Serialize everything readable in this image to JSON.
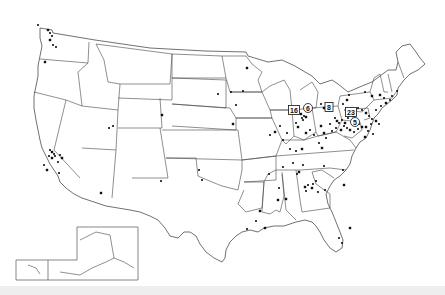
{
  "map": {
    "title": "United States site locations map",
    "colors": {
      "background": "#ffffff",
      "outline": "#444444",
      "marker": "#111111"
    },
    "cluster_labels": [
      {
        "text": "16",
        "shape": "box",
        "x": 294,
        "y": 110
      },
      {
        "text": "6",
        "shape": "circle",
        "x": 308,
        "y": 108
      },
      {
        "text": "8",
        "shape": "box",
        "x": 329,
        "y": 107
      },
      {
        "text": "23",
        "shape": "box",
        "x": 351,
        "y": 112
      },
      {
        "text": "5",
        "shape": "circle",
        "x": 355,
        "y": 122
      }
    ],
    "markers": [
      [
        48,
        30
      ],
      [
        50,
        33
      ],
      [
        52,
        36
      ],
      [
        50,
        40
      ],
      [
        53,
        45
      ],
      [
        56,
        47
      ],
      [
        45,
        62
      ],
      [
        38,
        25
      ],
      [
        50,
        150
      ],
      [
        52,
        152
      ],
      [
        54,
        154
      ],
      [
        49,
        156
      ],
      [
        52,
        158
      ],
      [
        55,
        156
      ],
      [
        60,
        155
      ],
      [
        62,
        158
      ],
      [
        58,
        162
      ],
      [
        44,
        165
      ],
      [
        47,
        170
      ],
      [
        59,
        173
      ],
      [
        109,
        128
      ],
      [
        101,
        193
      ],
      [
        161,
        181
      ],
      [
        113,
        126
      ],
      [
        162,
        115
      ],
      [
        202,
        180
      ],
      [
        199,
        170
      ],
      [
        233,
        124
      ],
      [
        236,
        105
      ],
      [
        231,
        92
      ],
      [
        247,
        68
      ],
      [
        243,
        91
      ],
      [
        218,
        94
      ],
      [
        301,
        114
      ],
      [
        304,
        116
      ],
      [
        302,
        118
      ],
      [
        306,
        117
      ],
      [
        303,
        120
      ],
      [
        296,
        123
      ],
      [
        298,
        127
      ],
      [
        280,
        126
      ],
      [
        270,
        135
      ],
      [
        275,
        132
      ],
      [
        283,
        140
      ],
      [
        287,
        133
      ],
      [
        306,
        133
      ],
      [
        310,
        130
      ],
      [
        314,
        135
      ],
      [
        321,
        126
      ],
      [
        330,
        124
      ],
      [
        335,
        118
      ],
      [
        337,
        121
      ],
      [
        339,
        123
      ],
      [
        342,
        120
      ],
      [
        345,
        123
      ],
      [
        344,
        126
      ],
      [
        347,
        128
      ],
      [
        350,
        130
      ],
      [
        352,
        124
      ],
      [
        348,
        118
      ],
      [
        353,
        116
      ],
      [
        356,
        119
      ],
      [
        359,
        124
      ],
      [
        362,
        127
      ],
      [
        358,
        129
      ],
      [
        354,
        132
      ],
      [
        341,
        130
      ],
      [
        336,
        128
      ],
      [
        332,
        131
      ],
      [
        324,
        133
      ],
      [
        326,
        138
      ],
      [
        319,
        143
      ],
      [
        322,
        148
      ],
      [
        358,
        108
      ],
      [
        362,
        110
      ],
      [
        366,
        113
      ],
      [
        369,
        116
      ],
      [
        372,
        119
      ],
      [
        376,
        121
      ],
      [
        379,
        124
      ],
      [
        371,
        124
      ],
      [
        366,
        127
      ],
      [
        368,
        131
      ],
      [
        373,
        134
      ],
      [
        365,
        137
      ],
      [
        376,
        110
      ],
      [
        381,
        106
      ],
      [
        386,
        103
      ],
      [
        390,
        100
      ],
      [
        384,
        98
      ],
      [
        380,
        95
      ],
      [
        392,
        96
      ],
      [
        397,
        91
      ],
      [
        372,
        96
      ],
      [
        365,
        92
      ],
      [
        349,
        95
      ],
      [
        347,
        100
      ],
      [
        343,
        104
      ],
      [
        321,
        104
      ],
      [
        324,
        108
      ],
      [
        290,
        149
      ],
      [
        296,
        151
      ],
      [
        302,
        149
      ],
      [
        283,
        167
      ],
      [
        293,
        163
      ],
      [
        299,
        172
      ],
      [
        303,
        165
      ],
      [
        297,
        174
      ],
      [
        305,
        187
      ],
      [
        308,
        185
      ],
      [
        306,
        191
      ],
      [
        312,
        188
      ],
      [
        313,
        184
      ],
      [
        316,
        181
      ],
      [
        286,
        199
      ],
      [
        279,
        188
      ],
      [
        269,
        174
      ],
      [
        278,
        200
      ],
      [
        318,
        192
      ],
      [
        325,
        190
      ],
      [
        344,
        185
      ],
      [
        324,
        166
      ],
      [
        343,
        170
      ],
      [
        350,
        228
      ],
      [
        339,
        238
      ],
      [
        342,
        243
      ],
      [
        260,
        211
      ],
      [
        247,
        229
      ],
      [
        256,
        221
      ],
      [
        265,
        228
      ]
    ]
  }
}
